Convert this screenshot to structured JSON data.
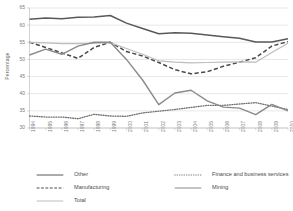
{
  "chart_data": {
    "type": "line",
    "title": "",
    "xlabel": "",
    "ylabel": "Percentage",
    "ylim": [
      30,
      65
    ],
    "ytick_values": [
      30,
      35,
      40,
      45,
      50,
      55,
      60,
      65
    ],
    "grid": true,
    "legend_position": "bottom",
    "categories": [
      "1994",
      "1995",
      "1996",
      "1997",
      "1998",
      "1999",
      "2000",
      "2001",
      "2002",
      "2003",
      "2004",
      "2005",
      "2006",
      "2007",
      "2008",
      "2009",
      "2010"
    ],
    "series": [
      {
        "name": "Other",
        "style": "solid",
        "color": "#595959",
        "width": 1.5,
        "values": [
          61.7,
          62.1,
          61.9,
          62.3,
          62.4,
          62.8,
          60.6,
          59.0,
          57.5,
          57.8,
          57.6,
          57.1,
          56.6,
          56.2,
          55.1,
          55.1,
          56.0
        ]
      },
      {
        "name": "Manufacturing",
        "style": "dashed",
        "color": "#4a4a4a",
        "width": 1.5,
        "values": [
          55.0,
          53.5,
          51.9,
          50.3,
          53.5,
          55.0,
          52.3,
          51.0,
          49.1,
          47.0,
          45.8,
          46.4,
          48.0,
          49.2,
          50.5,
          53.9,
          55.2
        ]
      },
      {
        "name": "Total",
        "style": "solid",
        "color": "#bdbdbd",
        "width": 1.2,
        "values": [
          55.0,
          54.8,
          54.6,
          54.6,
          54.7,
          54.9,
          53.2,
          51.5,
          49.6,
          49.2,
          49.0,
          49.1,
          49.2,
          49.3,
          49.2,
          52.0,
          54.7
        ]
      },
      {
        "name": "Finance and business services",
        "style": "dotted",
        "color": "#6e6e6e",
        "width": 1.3,
        "values": [
          33.5,
          33.2,
          33.2,
          32.7,
          34.0,
          33.5,
          33.4,
          34.4,
          34.9,
          35.4,
          36.0,
          36.6,
          36.6,
          37.0,
          37.4,
          36.4,
          35.4
        ]
      },
      {
        "name": "Mining",
        "style": "solid",
        "color": "#8a8a8a",
        "width": 1.4,
        "values": [
          51.3,
          53.0,
          51.5,
          53.9,
          55.0,
          55.0,
          50.0,
          44.0,
          36.8,
          40.2,
          41.0,
          37.9,
          36.1,
          35.8,
          33.9,
          36.9,
          35.0
        ]
      }
    ]
  },
  "axis": {
    "y_title": "Percentage",
    "y_ticks": [
      "65",
      "60",
      "55",
      "50",
      "45",
      "40",
      "35",
      "30"
    ],
    "x_ticks": [
      "1994",
      "1995",
      "1996",
      "1997",
      "1998",
      "1999",
      "2000",
      "2001",
      "2002",
      "2003",
      "2004",
      "2005",
      "2006",
      "2007",
      "2008",
      "2009",
      "2010"
    ]
  },
  "legend": {
    "items": [
      {
        "label": "Other",
        "style": "solid",
        "color": "#595959"
      },
      {
        "label": "Finance and business services",
        "style": "dotted",
        "color": "#6e6e6e"
      },
      {
        "label": "Manufacturing",
        "style": "dashed",
        "color": "#4a4a4a"
      },
      {
        "label": "Mining",
        "style": "solid",
        "color": "#8a8a8a"
      },
      {
        "label": "Total",
        "style": "solid",
        "color": "#bdbdbd"
      }
    ]
  }
}
